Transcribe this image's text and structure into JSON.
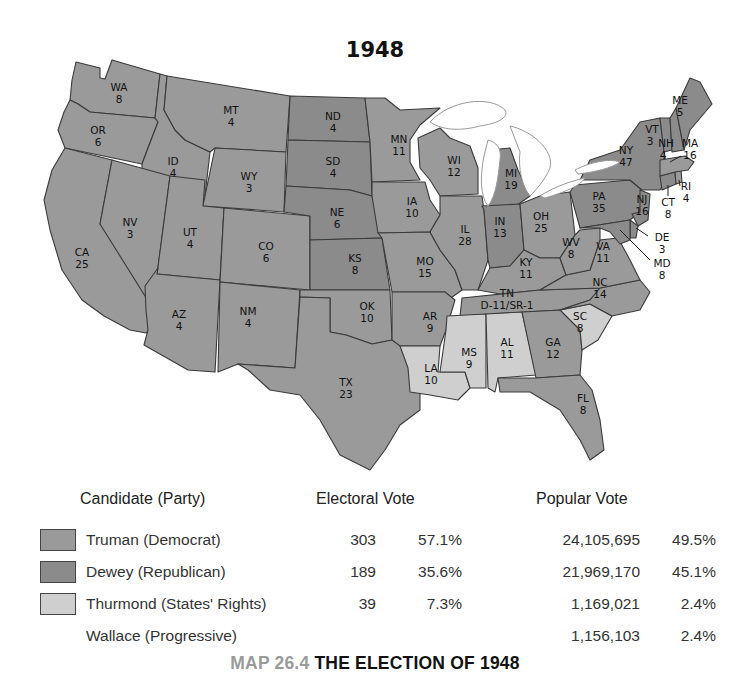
{
  "map": {
    "title": "1948",
    "colors": {
      "truman": "#9a9a9a",
      "dewey": "#8b8b8b",
      "thurmond": "#cfcfcf"
    },
    "states": [
      {
        "abbr": "WA",
        "ev": "8",
        "winner": "truman"
      },
      {
        "abbr": "OR",
        "ev": "6",
        "winner": "truman"
      },
      {
        "abbr": "CA",
        "ev": "25",
        "winner": "truman"
      },
      {
        "abbr": "ID",
        "ev": "4",
        "winner": "truman"
      },
      {
        "abbr": "NV",
        "ev": "3",
        "winner": "truman"
      },
      {
        "abbr": "MT",
        "ev": "4",
        "winner": "truman"
      },
      {
        "abbr": "WY",
        "ev": "3",
        "winner": "truman"
      },
      {
        "abbr": "UT",
        "ev": "4",
        "winner": "truman"
      },
      {
        "abbr": "AZ",
        "ev": "4",
        "winner": "truman"
      },
      {
        "abbr": "CO",
        "ev": "6",
        "winner": "truman"
      },
      {
        "abbr": "NM",
        "ev": "4",
        "winner": "truman"
      },
      {
        "abbr": "ND",
        "ev": "4",
        "winner": "dewey"
      },
      {
        "abbr": "SD",
        "ev": "4",
        "winner": "dewey"
      },
      {
        "abbr": "NE",
        "ev": "6",
        "winner": "dewey"
      },
      {
        "abbr": "KS",
        "ev": "8",
        "winner": "dewey"
      },
      {
        "abbr": "OK",
        "ev": "10",
        "winner": "truman"
      },
      {
        "abbr": "TX",
        "ev": "23",
        "winner": "truman"
      },
      {
        "abbr": "MN",
        "ev": "11",
        "winner": "truman"
      },
      {
        "abbr": "IA",
        "ev": "10",
        "winner": "truman"
      },
      {
        "abbr": "MO",
        "ev": "15",
        "winner": "truman"
      },
      {
        "abbr": "AR",
        "ev": "9",
        "winner": "truman"
      },
      {
        "abbr": "LA",
        "ev": "10",
        "winner": "thurmond"
      },
      {
        "abbr": "WI",
        "ev": "12",
        "winner": "truman"
      },
      {
        "abbr": "IL",
        "ev": "28",
        "winner": "truman"
      },
      {
        "abbr": "MI",
        "ev": "19",
        "winner": "dewey"
      },
      {
        "abbr": "IN",
        "ev": "13",
        "winner": "dewey"
      },
      {
        "abbr": "OH",
        "ev": "25",
        "winner": "truman"
      },
      {
        "abbr": "KY",
        "ev": "11",
        "winner": "truman"
      },
      {
        "abbr": "TN",
        "ev": "D-11/SR-1",
        "winner": "truman"
      },
      {
        "abbr": "MS",
        "ev": "9",
        "winner": "thurmond"
      },
      {
        "abbr": "AL",
        "ev": "11",
        "winner": "thurmond"
      },
      {
        "abbr": "GA",
        "ev": "12",
        "winner": "truman"
      },
      {
        "abbr": "FL",
        "ev": "8",
        "winner": "truman"
      },
      {
        "abbr": "SC",
        "ev": "8",
        "winner": "thurmond"
      },
      {
        "abbr": "NC",
        "ev": "14",
        "winner": "truman"
      },
      {
        "abbr": "VA",
        "ev": "11",
        "winner": "truman"
      },
      {
        "abbr": "WV",
        "ev": "8",
        "winner": "truman"
      },
      {
        "abbr": "PA",
        "ev": "35",
        "winner": "dewey"
      },
      {
        "abbr": "NY",
        "ev": "47",
        "winner": "dewey"
      },
      {
        "abbr": "NJ",
        "ev": "16",
        "winner": "dewey"
      },
      {
        "abbr": "DE",
        "ev": "3",
        "winner": "dewey"
      },
      {
        "abbr": "MD",
        "ev": "8",
        "winner": "dewey"
      },
      {
        "abbr": "CT",
        "ev": "8",
        "winner": "dewey"
      },
      {
        "abbr": "RI",
        "ev": "4",
        "winner": "truman"
      },
      {
        "abbr": "MA",
        "ev": "16",
        "winner": "truman"
      },
      {
        "abbr": "VT",
        "ev": "3",
        "winner": "dewey"
      },
      {
        "abbr": "NH",
        "ev": "4",
        "winner": "dewey"
      },
      {
        "abbr": "ME",
        "ev": "5",
        "winner": "dewey"
      }
    ]
  },
  "legend": {
    "headers": {
      "candidate": "Candidate (Party)",
      "electoral": "Electoral Vote",
      "popular": "Popular Vote"
    },
    "rows": [
      {
        "candidate": "Truman (Democrat)",
        "ev": "303",
        "ev_pct": "57.1%",
        "pv": "24,105,695",
        "pv_pct": "49.5%",
        "swatch": "#9a9a9a"
      },
      {
        "candidate": "Dewey (Republican)",
        "ev": "189",
        "ev_pct": "35.6%",
        "pv": "21,969,170",
        "pv_pct": "45.1%",
        "swatch": "#8b8b8b"
      },
      {
        "candidate": "Thurmond (States' Rights)",
        "ev": "39",
        "ev_pct": "7.3%",
        "pv": "1,169,021",
        "pv_pct": "2.4%",
        "swatch": "#cfcfcf"
      },
      {
        "candidate": "Wallace (Progressive)",
        "ev": "",
        "ev_pct": "",
        "pv": "1,156,103",
        "pv_pct": "2.4%",
        "swatch": ""
      }
    ]
  },
  "caption": {
    "number": "MAP 26.4",
    "title": "THE ELECTION OF 1948"
  }
}
